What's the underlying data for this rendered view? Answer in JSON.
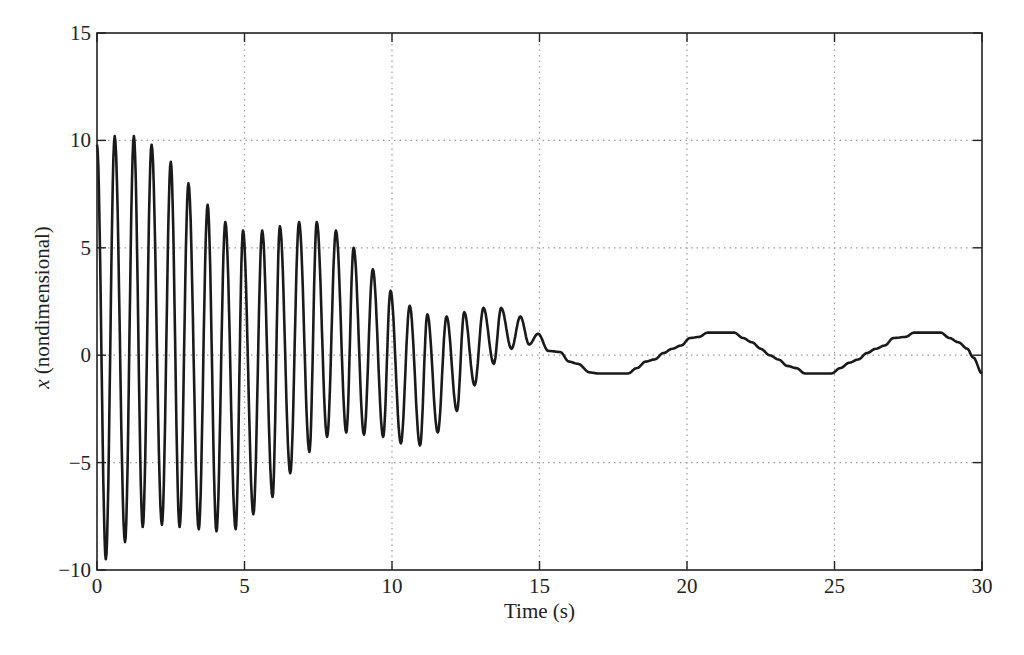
{
  "chart_data": {
    "type": "line",
    "title": "",
    "xlabel": "Time (s)",
    "ylabel_symbol": "x",
    "ylabel_text": " (nondimensional)",
    "xlim": [
      0,
      30
    ],
    "ylim": [
      -10,
      15
    ],
    "xticks": [
      0,
      5,
      10,
      15,
      20,
      25,
      30
    ],
    "yticks": [
      -10,
      -5,
      0,
      5,
      10,
      15
    ],
    "grid": true,
    "grid_style": "dotted",
    "legend": null,
    "line_color": "#1a1a1a",
    "series": [
      {
        "name": "x",
        "description": "Fast oscillation (~1.6 Hz) with decaying/beating envelope for t<15 s, then slow stepped oscillation of amplitude ~1 with period ~6 s",
        "oscillation_extrema": [
          [
            0.0,
            9.8
          ],
          [
            0.3,
            -9.5
          ],
          [
            0.6,
            10.2
          ],
          [
            0.95,
            -8.7
          ],
          [
            1.25,
            10.2
          ],
          [
            1.55,
            -8.0
          ],
          [
            1.85,
            9.8
          ],
          [
            2.2,
            -7.9
          ],
          [
            2.5,
            9.0
          ],
          [
            2.8,
            -8.0
          ],
          [
            3.1,
            8.0
          ],
          [
            3.45,
            -8.1
          ],
          [
            3.75,
            7.0
          ],
          [
            4.05,
            -8.2
          ],
          [
            4.35,
            6.2
          ],
          [
            4.7,
            -8.1
          ],
          [
            4.95,
            5.8
          ],
          [
            5.3,
            -7.4
          ],
          [
            5.6,
            5.8
          ],
          [
            5.95,
            -6.6
          ],
          [
            6.2,
            6.0
          ],
          [
            6.55,
            -5.5
          ],
          [
            6.85,
            6.2
          ],
          [
            7.2,
            -4.5
          ],
          [
            7.45,
            6.2
          ],
          [
            7.8,
            -3.8
          ],
          [
            8.1,
            5.8
          ],
          [
            8.45,
            -3.6
          ],
          [
            8.7,
            5.0
          ],
          [
            9.05,
            -3.7
          ],
          [
            9.35,
            4.0
          ],
          [
            9.7,
            -3.8
          ],
          [
            9.95,
            3.0
          ],
          [
            10.3,
            -4.1
          ],
          [
            10.6,
            2.3
          ],
          [
            10.95,
            -4.2
          ],
          [
            11.2,
            1.9
          ],
          [
            11.55,
            -3.6
          ],
          [
            11.85,
            1.8
          ],
          [
            12.2,
            -2.6
          ],
          [
            12.45,
            2.0
          ],
          [
            12.8,
            -1.4
          ],
          [
            13.1,
            2.2
          ],
          [
            13.45,
            -0.4
          ],
          [
            13.7,
            2.2
          ],
          [
            14.05,
            0.3
          ],
          [
            14.35,
            1.8
          ],
          [
            14.65,
            0.5
          ],
          [
            14.95,
            1.0
          ],
          [
            15.3,
            0.2
          ]
        ],
        "slow_points": [
          [
            15.3,
            0.2
          ],
          [
            15.7,
            0.15
          ],
          [
            16.0,
            -0.3
          ],
          [
            16.3,
            -0.4
          ],
          [
            16.7,
            -0.8
          ],
          [
            17.0,
            -0.85
          ],
          [
            17.5,
            -0.85
          ],
          [
            18.0,
            -0.85
          ],
          [
            18.3,
            -0.6
          ],
          [
            18.6,
            -0.3
          ],
          [
            18.9,
            -0.2
          ],
          [
            19.2,
            0.1
          ],
          [
            19.5,
            0.3
          ],
          [
            19.8,
            0.45
          ],
          [
            20.1,
            0.8
          ],
          [
            20.4,
            0.85
          ],
          [
            20.7,
            1.05
          ],
          [
            21.2,
            1.05
          ],
          [
            21.6,
            1.05
          ],
          [
            21.9,
            0.8
          ],
          [
            22.2,
            0.6
          ],
          [
            22.5,
            0.3
          ],
          [
            22.8,
            0.0
          ],
          [
            23.1,
            -0.2
          ],
          [
            23.4,
            -0.5
          ],
          [
            23.7,
            -0.6
          ],
          [
            24.0,
            -0.85
          ],
          [
            24.5,
            -0.85
          ],
          [
            24.9,
            -0.85
          ],
          [
            25.2,
            -0.6
          ],
          [
            25.5,
            -0.35
          ],
          [
            25.8,
            -0.2
          ],
          [
            26.1,
            0.1
          ],
          [
            26.4,
            0.3
          ],
          [
            26.7,
            0.45
          ],
          [
            27.0,
            0.8
          ],
          [
            27.4,
            0.85
          ],
          [
            27.7,
            1.05
          ],
          [
            28.2,
            1.05
          ],
          [
            28.6,
            1.05
          ],
          [
            28.9,
            0.8
          ],
          [
            29.2,
            0.6
          ],
          [
            29.5,
            0.3
          ],
          [
            29.7,
            -0.1
          ],
          [
            30.0,
            -0.85
          ]
        ]
      }
    ]
  },
  "layout_px": {
    "plot_left": 97,
    "plot_right": 982,
    "plot_top": 33,
    "plot_bottom": 570
  }
}
